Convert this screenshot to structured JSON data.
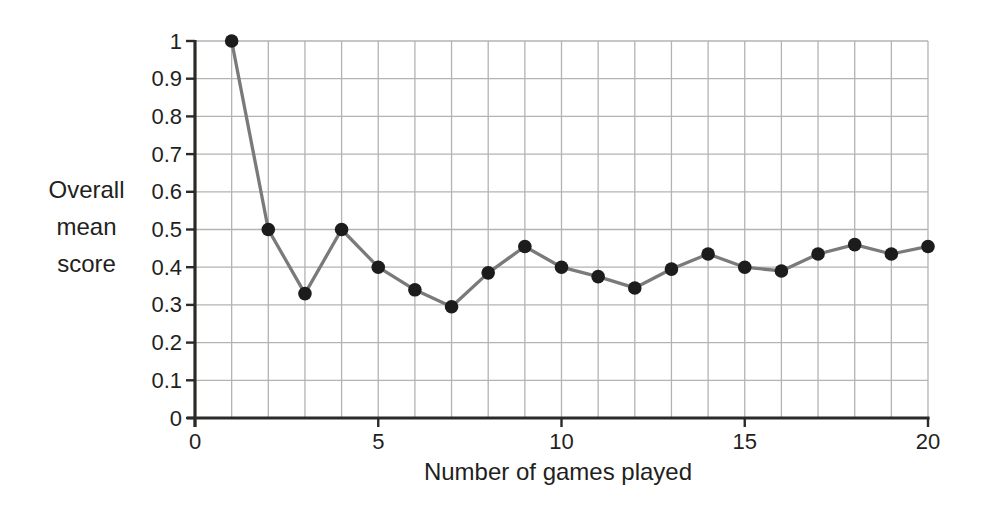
{
  "chart_data": {
    "type": "line",
    "title": "",
    "xlabel": "Number of games played",
    "ylabel": "Overall mean score",
    "ylabel_lines": [
      "Overall",
      "mean",
      "score"
    ],
    "x": [
      1,
      2,
      3,
      4,
      5,
      6,
      7,
      8,
      9,
      10,
      11,
      12,
      13,
      14,
      15,
      16,
      17,
      18,
      19,
      20
    ],
    "y": [
      1.0,
      0.5,
      0.33,
      0.5,
      0.4,
      0.34,
      0.295,
      0.385,
      0.455,
      0.4,
      0.375,
      0.345,
      0.395,
      0.435,
      0.4,
      0.39,
      0.435,
      0.46,
      0.435,
      0.455
    ],
    "series": [
      {
        "name": "Overall mean score",
        "values": [
          1.0,
          0.5,
          0.33,
          0.5,
          0.4,
          0.34,
          0.295,
          0.385,
          0.455,
          0.4,
          0.375,
          0.345,
          0.395,
          0.435,
          0.4,
          0.39,
          0.435,
          0.46,
          0.435,
          0.455
        ]
      }
    ],
    "xlim": [
      0,
      20
    ],
    "ylim": [
      0,
      1
    ],
    "x_ticks": [
      0,
      5,
      10,
      15,
      20
    ],
    "x_tick_labels": [
      "0",
      "5",
      "10",
      "15",
      "20"
    ],
    "y_ticks": [
      0,
      0.1,
      0.2,
      0.3,
      0.4,
      0.5,
      0.6,
      0.7,
      0.8,
      0.9,
      1
    ],
    "y_tick_labels": [
      "0",
      "0.1",
      "0.2",
      "0.3",
      "0.4",
      "0.5",
      "0.6",
      "0.7",
      "0.8",
      "0.9",
      "1"
    ],
    "x_gridlines": [
      1,
      2,
      3,
      4,
      5,
      6,
      7,
      8,
      9,
      10,
      11,
      12,
      13,
      14,
      15,
      16,
      17,
      18,
      19,
      20
    ],
    "y_gridlines": [
      0.1,
      0.2,
      0.3,
      0.4,
      0.5,
      0.6,
      0.7,
      0.8,
      0.9,
      1
    ],
    "grid": true,
    "legend": "none",
    "marker": "filled-circle",
    "colors": {
      "line": "#7a7a7a",
      "marker": "#1c1c1c",
      "grid": "#b3b3b3",
      "axis": "#2b2a29",
      "text": "#231f20",
      "background": "#ffffff"
    }
  }
}
